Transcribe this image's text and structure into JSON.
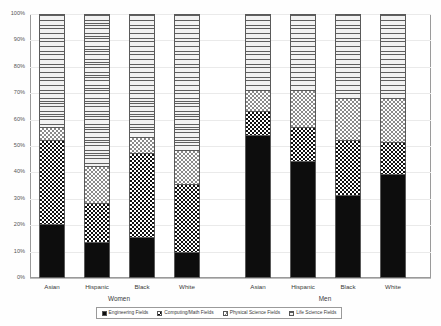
{
  "chart_data": {
    "type": "bar",
    "subtype": "stacked-100-percent",
    "title": "",
    "subtitle": "",
    "xlabel": "",
    "ylabel": "",
    "ylim": [
      0,
      100
    ],
    "grid": true,
    "legend_position": "bottom",
    "y_tick_labels": [
      "100%",
      "90%",
      "80%",
      "70%",
      "60%",
      "50%",
      "40%",
      "30%",
      "20%",
      "10%",
      "0%"
    ],
    "y_tick_values": [
      100,
      90,
      80,
      70,
      60,
      50,
      40,
      30,
      20,
      10,
      0
    ],
    "categories": [
      "Asian",
      "Hispanic",
      "Black",
      "White",
      "Asian",
      "Hispanic",
      "Black",
      "White"
    ],
    "groups": [
      {
        "label": "Women",
        "categories": [
          "Asian",
          "Hispanic",
          "Black",
          "White"
        ]
      },
      {
        "label": "Men",
        "categories": [
          "Asian",
          "Hispanic",
          "Black",
          "White"
        ]
      }
    ],
    "series": [
      {
        "name": "Engineering Fields",
        "pattern": "solid-black",
        "values": [
          20,
          13,
          15,
          9,
          54,
          44,
          31,
          39
        ]
      },
      {
        "name": "Computing/Math Fields",
        "pattern": "dark-checker",
        "values": [
          32,
          15,
          32,
          26,
          9,
          13,
          21,
          12
        ]
      },
      {
        "name": "Physical Science Fields",
        "pattern": "light-checker",
        "values": [
          5,
          14,
          6,
          13,
          8,
          14,
          16,
          17
        ]
      },
      {
        "name": "Life Science Fields",
        "pattern": "horizontal-lines",
        "values": [
          43,
          58,
          47,
          52,
          29,
          29,
          32,
          32
        ]
      }
    ],
    "legend": [
      {
        "label": "Engineering Fields",
        "pattern": "solid-black"
      },
      {
        "label": "Computing/Math Fields",
        "pattern": "dark-checker"
      },
      {
        "label": "Physical Science Fields",
        "pattern": "light-checker"
      },
      {
        "label": "Life Science Fields",
        "pattern": "horizontal-lines"
      }
    ],
    "colors": {
      "engineering": "#0d0d0d",
      "computing": "#111111",
      "physical": "#8a8a8a",
      "life": "#e6e6e6",
      "grid": "#eaeaea",
      "frame": "#9a9a9a",
      "text": "#3a3a3a"
    }
  }
}
